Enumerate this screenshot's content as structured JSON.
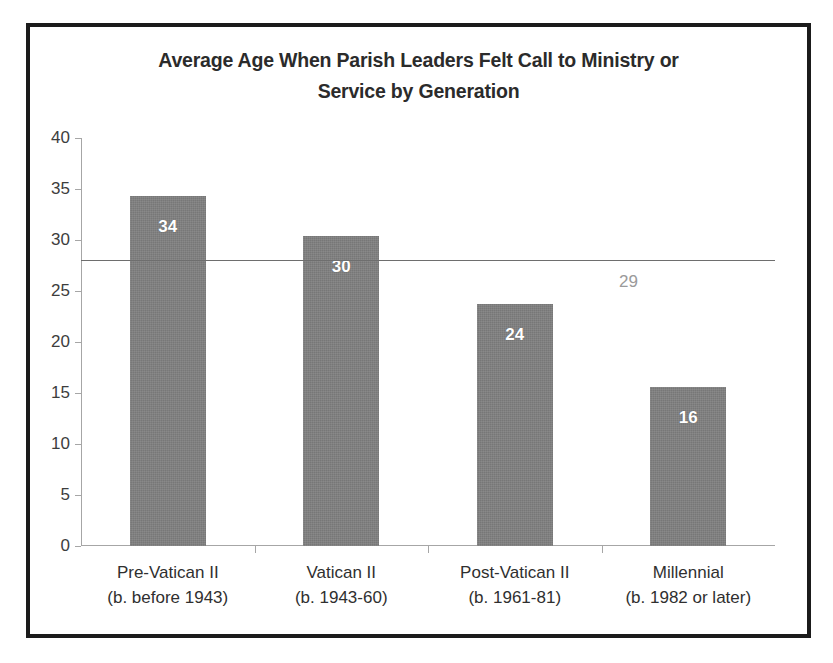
{
  "chart_data": {
    "type": "bar",
    "title": "Average Age When Parish Leaders Felt Call to Ministry or Service by Generation",
    "title_line1": "Average Age When Parish Leaders Felt Call to Ministry or",
    "title_line2": "Service by Generation",
    "xlabel": "",
    "ylabel": "",
    "ylim": [
      0,
      40
    ],
    "ytick_step": 5,
    "yticks": [
      "40",
      "35",
      "30",
      "25",
      "20",
      "15",
      "10",
      "5",
      "0"
    ],
    "ytick_values": [
      40,
      35,
      30,
      25,
      20,
      15,
      10,
      5,
      0
    ],
    "grid": false,
    "legend": "none",
    "categories": [
      "Pre-Vatican II",
      "Vatican II",
      "Post-Vatican II",
      "Millennial"
    ],
    "category_sublabels": [
      "(b. before 1943)",
      "(b. 1943-60)",
      "(b. 1961-81)",
      "(b. 1982 or later)"
    ],
    "values": [
      34.3,
      30.4,
      23.7,
      15.6
    ],
    "data_labels": [
      "34",
      "30",
      "24",
      "16"
    ],
    "reference_line": {
      "value": 28,
      "label": "29",
      "name": "overall-average"
    },
    "colors": {
      "bar_fill": "#7f7f7f",
      "axis": "#a6a6a6",
      "title_text": "#2b2b2b",
      "tick_text": "#3d3d3d",
      "data_label_text": "#ffffff",
      "reference_line": "#6e6e6e",
      "reference_label_text": "#9a9a9a",
      "frame_border": "#1b1b1b",
      "background": "#ffffff"
    }
  }
}
